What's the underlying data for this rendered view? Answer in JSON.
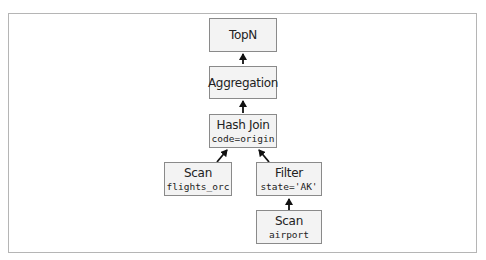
{
  "diagram": {
    "type": "query-plan-tree",
    "nodes": [
      {
        "id": "topn",
        "title": "TopN",
        "detail": ""
      },
      {
        "id": "aggregation",
        "title": "Aggregation",
        "detail": ""
      },
      {
        "id": "hash_join",
        "title": "Hash Join",
        "detail": "code=origin"
      },
      {
        "id": "scan_flights",
        "title": "Scan",
        "detail": "flights_orc"
      },
      {
        "id": "filter",
        "title": "Filter",
        "detail": "state='AK'"
      },
      {
        "id": "scan_airport",
        "title": "Scan",
        "detail": "airport"
      }
    ],
    "edges": [
      {
        "from": "aggregation",
        "to": "topn"
      },
      {
        "from": "hash_join",
        "to": "aggregation"
      },
      {
        "from": "scan_flights",
        "to": "hash_join"
      },
      {
        "from": "filter",
        "to": "hash_join"
      },
      {
        "from": "scan_airport",
        "to": "filter"
      }
    ],
    "colors": {
      "node_fill": "#f3f3f3",
      "node_border": "#8a8a8a",
      "arrow": "#111111",
      "frame": "#b5b5b5"
    }
  }
}
